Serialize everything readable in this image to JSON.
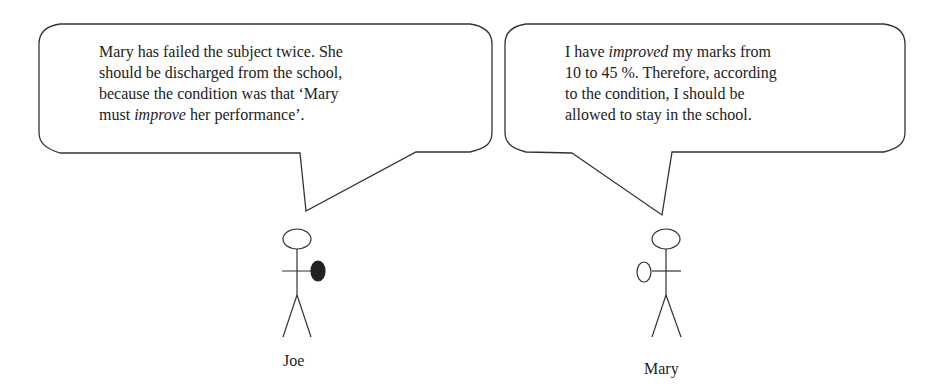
{
  "left_bubble": {
    "speaker": "Joe",
    "line1": "Mary has failed the subject twice. She",
    "line2": "should be discharged from the school,",
    "line3": "because the condition was that ‘Mary",
    "line4_pre": "must ",
    "line4_em": "improve",
    "line4_post": " her performance’."
  },
  "right_bubble": {
    "speaker": "Mary",
    "line1_pre": "I have ",
    "line1_em": "improved",
    "line1_post": " my marks from",
    "line2": "10 to 45 %. Therefore, according",
    "line3": "to the condition, I should be",
    "line4": "allowed to stay in the school."
  },
  "figures": {
    "left_label": "Joe",
    "right_label": "Mary",
    "colors": {
      "line": "#333333",
      "filled_hand": "#222222"
    }
  }
}
